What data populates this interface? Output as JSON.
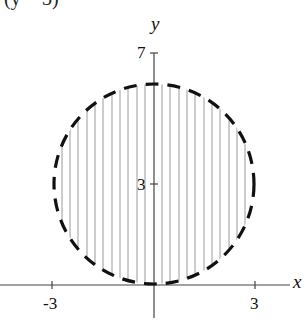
{
  "header": {
    "cropped_text": "(y − 3)"
  },
  "graph": {
    "x_axis_label": "x",
    "y_axis_label": "y",
    "x_ticks": [
      {
        "value": -3,
        "label": "-3"
      },
      {
        "value": 3,
        "label": "3"
      }
    ],
    "y_ticks": [
      {
        "value": 3,
        "label": "3"
      },
      {
        "value": 7,
        "label": "7"
      }
    ],
    "circle": {
      "center_x": 0,
      "center_y": 3,
      "radius": 3,
      "boundary": "dashed",
      "interior": "shaded with vertical lines"
    },
    "colors": {
      "boundary": "#111111",
      "hatch": "#9a9a9a",
      "axes": "#444444"
    }
  }
}
